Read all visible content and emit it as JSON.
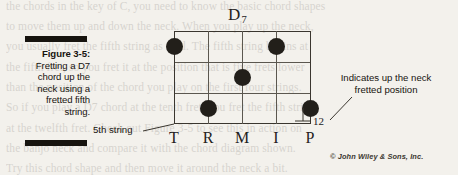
{
  "figure": {
    "caption_title": "Figure 3-5:",
    "caption_lines": [
      "Fretting a D7",
      "chord up the",
      "neck using a",
      "fretted fifth",
      "string."
    ],
    "chord_name_letter": "D",
    "chord_name_sub": "7",
    "fret_number_label": "12",
    "fifth_string_label": "5th string",
    "annotation_lines": [
      "Indicates up the neck",
      "fretted position"
    ],
    "finger_labels": [
      "T",
      "R",
      "M",
      "I",
      "P"
    ],
    "credit": "© John Wiley & Sons, Inc.",
    "colors": {
      "ink": "#17140f",
      "dot": "#221f1a",
      "grid": "#5b574f",
      "paper": "#f3f1ec"
    },
    "grid": {
      "strings": 5,
      "fret_lines": 4,
      "string_x": [
        0,
        34,
        68,
        102,
        136
      ],
      "fret_y": [
        0,
        31,
        62,
        92
      ]
    },
    "dots": [
      {
        "string_index": 0,
        "fret_row": 0,
        "x": 0,
        "y": 15.5
      },
      {
        "string_index": 3,
        "fret_row": 0,
        "x": 102,
        "y": 15.5
      },
      {
        "string_index": 2,
        "fret_row": 1,
        "x": 68,
        "y": 46.5
      },
      {
        "string_index": 1,
        "fret_row": 2,
        "x": 34,
        "y": 77
      },
      {
        "string_index": 4,
        "fret_row": 2,
        "x": 136,
        "y": 77
      }
    ],
    "bleed_text": [
      {
        "top": -4,
        "text": "the chords in the key of C, you need to know the basic chord shapes"
      },
      {
        "top": 16,
        "text": "to move them up and down the neck. When you play up the neck,"
      },
      {
        "top": 36,
        "text": "you usually fret the fifth string as well. The fifth string begins at"
      },
      {
        "top": 57,
        "text": "the fifth fret, so you fret it at the position that is five frets lower"
      },
      {
        "top": 77,
        "text": "than the position of the chord you play on the first four strings."
      },
      {
        "top": 97,
        "text": "So if you play a D7 chord at the tenth fret, you fret the fifth string"
      },
      {
        "top": 118,
        "text": "at the twelfth fret. Check out Figure 3-5 to see this in action on"
      },
      {
        "top": 138,
        "text": "the banjo neck and compare it with the chord diagram shown."
      },
      {
        "top": 158,
        "text": "Try this chord shape and then move it around the neck a bit."
      }
    ]
  }
}
